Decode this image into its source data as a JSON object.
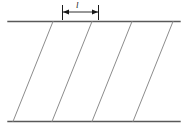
{
  "figure": {
    "type": "technical-line-diagram",
    "canvas": {
      "width": 186,
      "height": 134,
      "background": "#ffffff"
    },
    "colors": {
      "band_edge": "#595959",
      "helix_line": "#8c8c8c",
      "dimension_line": "#1a1a1a",
      "label_text": "#1a1a1a"
    },
    "band": {
      "top_line_y": 21.5,
      "bottom_line_y": 121.5,
      "left_x": 8,
      "right_x": 180,
      "stroke_width": 1.4
    },
    "helix_lines": {
      "count": 4,
      "stroke_width": 1.0,
      "top_x": [
        53,
        92,
        132,
        173
      ],
      "bottom_x": [
        13,
        52,
        92,
        133
      ],
      "slant": "down-right",
      "spacing_px": 40
    },
    "dimension": {
      "label": "l",
      "label_meaning": "pitch",
      "line_y": 12,
      "start_x": 62,
      "end_x": 99,
      "tick_top_y": 5,
      "tick_bottom_y": 20,
      "arrow_size": 4,
      "label_x": 77,
      "label_y": 1
    }
  }
}
